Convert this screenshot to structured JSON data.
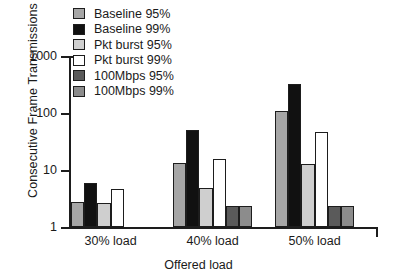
{
  "chart_data": {
    "type": "bar",
    "title": "",
    "xlabel": "Offered load",
    "ylabel": "Consecutive Frame Transmissions",
    "yscale": "log",
    "ylim": [
      1,
      1000
    ],
    "ytick_labels": [
      "1000",
      "100",
      "10",
      "1"
    ],
    "ytick_values": [
      1000,
      100,
      10,
      1
    ],
    "grid": false,
    "legend_position": "top-left-inside",
    "categories": [
      "30% load",
      "40% load",
      "50% load"
    ],
    "series": [
      {
        "name": "Baseline 95%",
        "color": "#a6a6a6",
        "values": [
          2.8,
          13.5,
          110
        ]
      },
      {
        "name": "Baseline 99%",
        "color": "#111111",
        "values": [
          6.0,
          50.0,
          320
        ]
      },
      {
        "name": "Pkt burst 95%",
        "color": "#cfcfcf",
        "values": [
          2.6,
          4.9,
          13.0
        ]
      },
      {
        "name": "Pkt burst 99%",
        "color": "#ffffff",
        "values": [
          4.7,
          15.5,
          46.0
        ]
      },
      {
        "name": "100Mbps 95%",
        "color": "#5a5a5a",
        "values": [
          null,
          2.3,
          2.35
        ]
      },
      {
        "name": "100Mbps 99%",
        "color": "#8c8c8c",
        "values": [
          null,
          2.3,
          2.35
        ]
      }
    ]
  },
  "legend": {
    "items": [
      {
        "label": "Baseline 95%"
      },
      {
        "label": "Baseline 99%"
      },
      {
        "label": "Pkt burst 95%"
      },
      {
        "label": "Pkt burst 99%"
      },
      {
        "label": "100Mbps 95%"
      },
      {
        "label": "100Mbps 99%"
      }
    ]
  },
  "colors": {
    "axis": "#1d1d1d",
    "background": "#ffffff",
    "baseline_95": "#a6a6a6",
    "baseline_99": "#111111",
    "pkt_burst_95": "#cfcfcf",
    "pkt_burst_99": "#ffffff",
    "mbps_95": "#5a5a5a",
    "mbps_99": "#8c8c8c"
  }
}
